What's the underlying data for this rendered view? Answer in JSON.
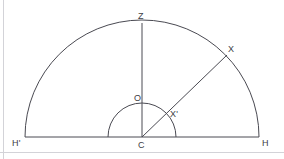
{
  "figure": {
    "background_color": "#ffffff",
    "stroke_color": "#4a4a52",
    "page_border_color": "#d3d3d8",
    "label_color": "#3d3d45",
    "width": 284,
    "height": 159
  },
  "labels": {
    "zenith": "Z",
    "star": "X",
    "origin": "O",
    "star_prime": "X'",
    "horizon_left": "H'",
    "center": "C",
    "horizon_right": "H"
  },
  "geometry": {
    "center": {
      "x": 142,
      "y": 137
    },
    "large_radius": 117,
    "small_radius": 34,
    "ray_angle_degrees": 44,
    "baseline": {
      "x1": 25,
      "y1": 137,
      "x2": 259,
      "y2": 137
    },
    "vertical_line": {
      "x1": 142,
      "y1": 137,
      "x2": 142,
      "y2": 23
    },
    "ray_line": {
      "x1": 142,
      "y1": 137,
      "x2": 227,
      "y2": 55
    },
    "points": {
      "zenith": {
        "x": 142,
        "y": 23
      },
      "star": {
        "x": 226,
        "y": 57
      },
      "origin": {
        "x": 142,
        "y": 103
      },
      "star_prime": {
        "x": 167,
        "y": 113
      },
      "horizon_left": {
        "x": 25,
        "y": 137
      },
      "horizon_right": {
        "x": 259,
        "y": 137
      }
    },
    "page_border": {
      "vertical_x": 3.5,
      "horizontal_y": 152.5
    }
  },
  "label_positions": {
    "zenith": {
      "left": 138,
      "top": 12
    },
    "star": {
      "left": 228,
      "top": 45
    },
    "origin": {
      "left": 134,
      "top": 94
    },
    "star_prime": {
      "left": 170,
      "top": 110
    },
    "horizon_left": {
      "left": 12,
      "top": 139
    },
    "center": {
      "left": 138,
      "top": 141
    },
    "horizon_right": {
      "left": 262,
      "top": 139
    }
  }
}
